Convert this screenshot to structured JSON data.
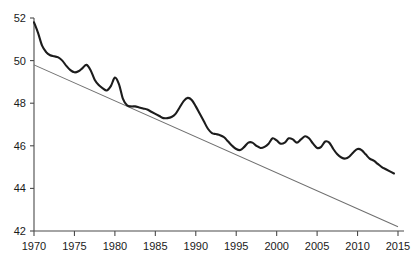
{
  "chart_data": {
    "type": "line",
    "title": "",
    "subtitle": "",
    "xlabel": "",
    "ylabel": "",
    "xlim": [
      1970,
      2015
    ],
    "ylim": [
      42,
      52
    ],
    "grid": false,
    "legend": false,
    "legend_position": "none",
    "x_ticks": [
      1970,
      1975,
      1980,
      1985,
      1990,
      1995,
      2000,
      2005,
      2010,
      2015
    ],
    "x_tick_labels": [
      "1970",
      "1975",
      "1980",
      "1985",
      "1990",
      "1995",
      "2000",
      "2005",
      "2010",
      "2015"
    ],
    "y_ticks": [
      42,
      44,
      46,
      48,
      50,
      52
    ],
    "y_tick_labels": [
      "42",
      "44",
      "46",
      "48",
      "50",
      "52"
    ],
    "series": [
      {
        "name": "observed",
        "type": "line",
        "color": "#1c1c1c",
        "width": 2.1,
        "x": [
          1970,
          1970.5,
          1971,
          1971.5,
          1972,
          1972.5,
          1973,
          1973.5,
          1974,
          1974.5,
          1975,
          1975.5,
          1976,
          1976.5,
          1977,
          1977.5,
          1978,
          1978.5,
          1979,
          1979.5,
          1980,
          1980.5,
          1981,
          1981.5,
          1982,
          1982.5,
          1983,
          1983.5,
          1984,
          1984.5,
          1985,
          1985.5,
          1986,
          1986.5,
          1987,
          1987.5,
          1988,
          1988.5,
          1989,
          1989.5,
          1990,
          1990.5,
          1991,
          1991.5,
          1992,
          1992.5,
          1993,
          1993.5,
          1994,
          1994.5,
          1995,
          1995.5,
          1996,
          1996.5,
          1997,
          1997.5,
          1998,
          1998.5,
          1999,
          1999.5,
          2000,
          2000.5,
          2001,
          2001.5,
          2002,
          2002.5,
          2003,
          2003.5,
          2004,
          2004.5,
          2005,
          2005.5,
          2006,
          2006.5,
          2007,
          2007.5,
          2008,
          2008.5,
          2009,
          2009.5,
          2010,
          2010.5,
          2011,
          2011.5,
          2012,
          2012.5,
          2013,
          2013.5,
          2014,
          2014.5
        ],
        "values": [
          51.8,
          51.3,
          50.7,
          50.4,
          50.25,
          50.2,
          50.15,
          50.0,
          49.75,
          49.55,
          49.45,
          49.5,
          49.65,
          49.8,
          49.55,
          49.1,
          48.85,
          48.7,
          48.6,
          48.8,
          49.2,
          48.9,
          48.2,
          47.9,
          47.85,
          47.85,
          47.8,
          47.75,
          47.7,
          47.6,
          47.5,
          47.4,
          47.3,
          47.3,
          47.35,
          47.5,
          47.8,
          48.1,
          48.25,
          48.15,
          47.85,
          47.5,
          47.15,
          46.8,
          46.6,
          46.55,
          46.5,
          46.4,
          46.2,
          46.0,
          45.85,
          45.8,
          45.95,
          46.15,
          46.15,
          46.0,
          45.9,
          45.95,
          46.1,
          46.35,
          46.25,
          46.1,
          46.15,
          46.35,
          46.3,
          46.15,
          46.3,
          46.45,
          46.35,
          46.1,
          45.9,
          45.95,
          46.2,
          46.15,
          45.85,
          45.6,
          45.45,
          45.4,
          45.5,
          45.7,
          45.85,
          45.8,
          45.6,
          45.4,
          45.3,
          45.15,
          45.0,
          44.9,
          44.8,
          44.7
        ]
      },
      {
        "name": "trend",
        "type": "line",
        "color": "#6e6e6e",
        "width": 1.05,
        "x": [
          1970,
          2015
        ],
        "values": [
          49.8,
          42.2
        ]
      }
    ]
  }
}
